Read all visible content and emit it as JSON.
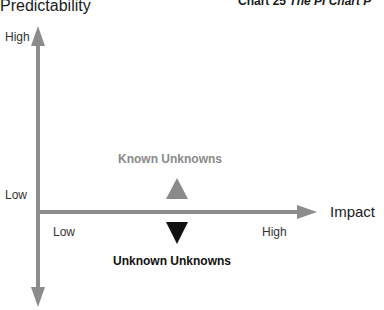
{
  "header": {
    "title_prefix": "Chart 25 ",
    "title_italic": "The PI Chart P"
  },
  "axes": {
    "y_axis": {
      "label": "Predictability",
      "high_label": "High",
      "low_label": "Low"
    },
    "x_axis": {
      "label": "Impact",
      "low_label": "Low",
      "high_label": "High"
    }
  },
  "markers": {
    "known_unknowns": {
      "label": "Known Unknowns",
      "shape": "triangle-up",
      "color": "#8a8a8a"
    },
    "unknown_unknowns": {
      "label": "Unknown Unknowns",
      "shape": "triangle-down",
      "color": "#111111"
    }
  },
  "colors": {
    "axis": "#8c8c8c",
    "known": "#8a8a8a",
    "unknown": "#111111"
  }
}
